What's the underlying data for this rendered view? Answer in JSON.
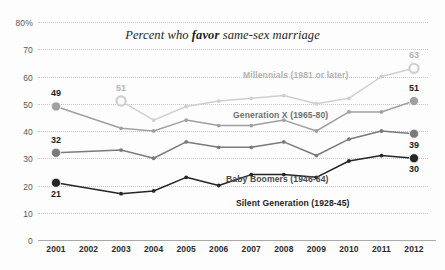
{
  "chart_data": {
    "type": "line",
    "title": "Percent who favor same-sex marriage",
    "title_plain": "Percent who ",
    "title_bold": "favor",
    "title_tail": " same-sex marriage",
    "xlabel": "",
    "ylabel": "",
    "grid": true,
    "legend": "inline-labels",
    "ylim": [
      0,
      80
    ],
    "yticks": [
      "0",
      "10",
      "20",
      "30",
      "40",
      "50",
      "60",
      "70",
      "80%"
    ],
    "ytick_values": [
      0,
      10,
      20,
      30,
      40,
      50,
      60,
      70,
      80
    ],
    "categories": [
      "2001",
      "2002",
      "2003",
      "2004",
      "2005",
      "2006",
      "2007",
      "2008",
      "2009",
      "2010",
      "2011",
      "2012"
    ],
    "x": [
      2001,
      2002,
      2003,
      2004,
      2005,
      2006,
      2007,
      2008,
      2009,
      2010,
      2011,
      2012
    ],
    "series": [
      {
        "name": "Millennials (1981 or later)",
        "label": "Millennials (1981 or later)",
        "color": "#cfcfcf",
        "label_color": "#b4b4b4",
        "values": [
          null,
          null,
          51,
          44,
          49,
          51,
          52,
          53,
          50,
          52,
          60,
          63
        ],
        "start_value": 51,
        "end_value": 63,
        "start_marker": "hollow-circle",
        "end_marker": "hollow-circle"
      },
      {
        "name": "Generation X (1965-80)",
        "label": "Generation X (1965-80)",
        "color": "#a0a0a0",
        "label_color": "#6f6f6f",
        "values": [
          49,
          null,
          41,
          40,
          44,
          42,
          42,
          44,
          40,
          47,
          47,
          51
        ],
        "start_value": 49,
        "end_value": 51,
        "start_marker": "filled-circle",
        "end_marker": "filled-circle"
      },
      {
        "name": "Baby Boomers (1946-64)",
        "label": "Baby Boomers (1946-64)",
        "color": "#7a7a7a",
        "label_color": "#4a4a4a",
        "values": [
          32,
          null,
          33,
          30,
          36,
          34,
          34,
          36,
          31,
          37,
          40,
          39
        ],
        "start_value": 32,
        "end_value": 39,
        "start_marker": "filled-circle",
        "end_marker": "filled-circle"
      },
      {
        "name": "Silent Generation (1928-45)",
        "label": "Silent Generation (1928-45)",
        "color": "#262626",
        "label_color": "#1d1d1d",
        "values": [
          21,
          null,
          17,
          18,
          23,
          20,
          24,
          24,
          23,
          29,
          31,
          30
        ],
        "start_value": 21,
        "end_value": 30,
        "start_marker": "filled-circle",
        "end_marker": "filled-circle"
      }
    ],
    "annotations": [
      {
        "text": "49",
        "series": "Generation X (1965-80)",
        "x": 2001,
        "value": 49,
        "position": "above"
      },
      {
        "text": "32",
        "series": "Baby Boomers (1946-64)",
        "x": 2001,
        "value": 32,
        "position": "above"
      },
      {
        "text": "21",
        "series": "Silent Generation (1928-45)",
        "x": 2001,
        "value": 21,
        "position": "below"
      },
      {
        "text": "51",
        "series": "Millennials (1981 or later)",
        "x": 2003,
        "value": 51,
        "position": "above"
      },
      {
        "text": "63",
        "series": "Millennials (1981 or later)",
        "x": 2012,
        "value": 63,
        "position": "above"
      },
      {
        "text": "51",
        "series": "Generation X (1965-80)",
        "x": 2012,
        "value": 51,
        "position": "above"
      },
      {
        "text": "39",
        "series": "Baby Boomers (1946-64)",
        "x": 2012,
        "value": 39,
        "position": "below"
      },
      {
        "text": "30",
        "series": "Silent Generation (1928-45)",
        "x": 2012,
        "value": 30,
        "position": "below"
      }
    ]
  }
}
